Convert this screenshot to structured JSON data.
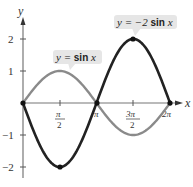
{
  "chart_data": {
    "type": "line",
    "title": "",
    "xlabel": "x",
    "ylabel": "y",
    "xlim": [
      0,
      6.2832
    ],
    "ylim": [
      -2,
      2
    ],
    "grid": false,
    "x_ticks": [
      "π/2",
      "π",
      "3π/2",
      "2π"
    ],
    "y_ticks": [
      "2",
      "1",
      "-1",
      "-2"
    ],
    "series": [
      {
        "name": "y = sin x",
        "color": "#8a8a8a",
        "x": [
          0,
          1.5708,
          3.1416,
          4.7124,
          6.2832
        ],
        "values": [
          0,
          1,
          0,
          -1,
          0
        ]
      },
      {
        "name": "y = −2 sin x",
        "color": "#222222",
        "x": [
          0,
          1.5708,
          3.1416,
          4.7124,
          6.2832
        ],
        "values": [
          0,
          -2,
          0,
          2,
          0
        ],
        "marked_points": [
          [
            0,
            0
          ],
          [
            1.5708,
            -2
          ],
          [
            3.1416,
            0
          ],
          [
            4.7124,
            2
          ],
          [
            6.2832,
            0
          ]
        ]
      }
    ],
    "annotations": [
      {
        "text_prefix": "y = ",
        "text_func": "sin",
        "text_var": "x",
        "target_series": "y = sin x"
      },
      {
        "text_prefix": "y = −2 ",
        "text_func": "sin",
        "text_var": "x",
        "target_series": "y = −2 sin x"
      }
    ]
  },
  "labels": {
    "x_axis": "x",
    "y_axis": "y",
    "y2": "2",
    "y1": "1",
    "ym1": "−1",
    "ym2": "−2",
    "pi_num": "π",
    "three_pi_num": "3π",
    "den": "2",
    "pi": "π",
    "two_pi": "2π",
    "callout_sin_prefix": "y = ",
    "callout_sin_func": "sin",
    "callout_sin_var": " x",
    "callout_neg_prefix": "y = −2 ",
    "callout_neg_func": "sin",
    "callout_neg_var": " x"
  }
}
